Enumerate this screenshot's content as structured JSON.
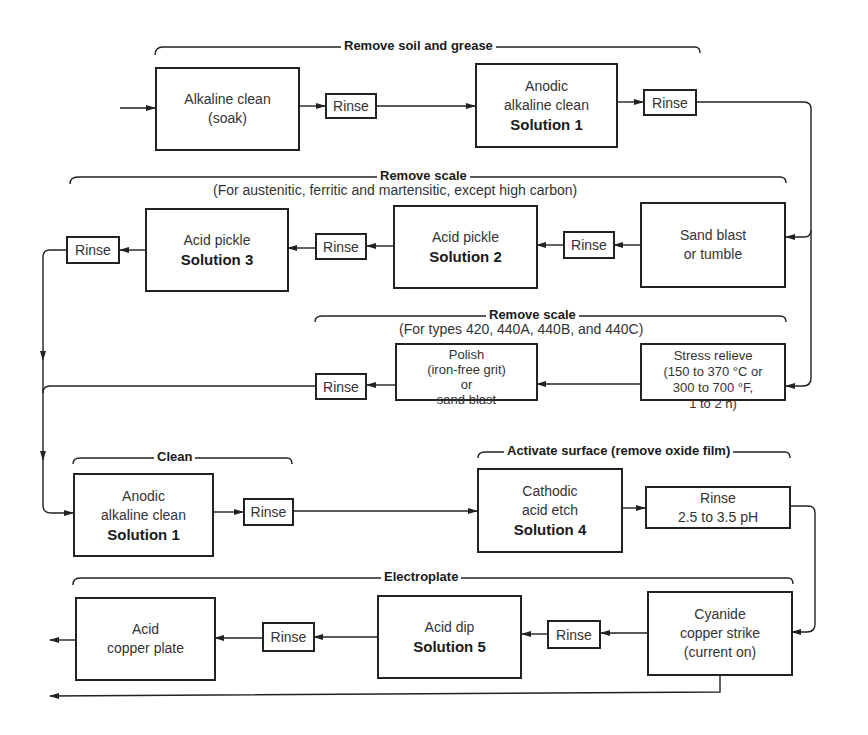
{
  "diagram": {
    "type": "process-flowchart",
    "groups": {
      "soil_grease": "Remove soil and grease",
      "scale_1": "Remove scale",
      "scale_1_note": "(For austenitic, ferritic and martensitic, except high carbon)",
      "scale_2": "Remove scale",
      "scale_2_note": "(For types 420, 440A, 440B, and 440C)",
      "clean": "Clean",
      "activate": "Activate surface (remove oxide film)",
      "electroplate": "Electroplate"
    },
    "steps": {
      "alkaline_soak": {
        "line1": "Alkaline clean",
        "line2": "(soak)"
      },
      "rinse_1": "Rinse",
      "anodic_1": {
        "line1": "Anodic",
        "line2": "alkaline clean",
        "solution": "Solution 1"
      },
      "rinse_2": "Rinse",
      "sand_blast": {
        "line1": "Sand blast",
        "line2": "or tumble"
      },
      "rinse_3": "Rinse",
      "acid_pickle_2": {
        "line1": "Acid pickle",
        "solution": "Solution 2"
      },
      "rinse_4": "Rinse",
      "acid_pickle_3": {
        "line1": "Acid pickle",
        "solution": "Solution 3"
      },
      "rinse_5": "Rinse",
      "stress_relieve": {
        "line1": "Stress relieve",
        "line2": "(150 to 370 °C or",
        "line3": "300 to 700 °F,",
        "line4": "1 to 2 h)"
      },
      "polish": {
        "line1": "Polish",
        "line2": "(iron-free grit)",
        "line3": "or",
        "line4": "sand blast"
      },
      "rinse_6": "Rinse",
      "anodic_2": {
        "line1": "Anodic",
        "line2": "alkaline clean",
        "solution": "Solution 1"
      },
      "rinse_7": "Rinse",
      "cathodic": {
        "line1": "Cathodic",
        "line2": "acid etch",
        "solution": "Solution 4"
      },
      "rinse_ph": {
        "line1": "Rinse",
        "line2": "2.5 to 3.5 pH"
      },
      "cyanide": {
        "line1": "Cyanide",
        "line2": "copper strike",
        "line3": "(current on)"
      },
      "rinse_8": "Rinse",
      "acid_dip": {
        "line1": "Acid dip",
        "solution": "Solution 5"
      },
      "rinse_9": "Rinse",
      "acid_copper": {
        "line1": "Acid",
        "line2": "copper plate"
      }
    },
    "colors": {
      "line": "#222222",
      "text": "#333333",
      "background": "#ffffff"
    }
  }
}
